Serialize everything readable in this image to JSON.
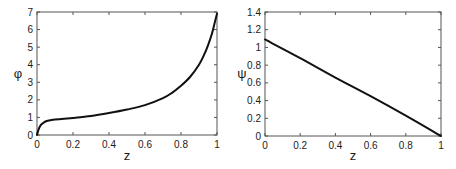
{
  "chart_data": [
    {
      "type": "line",
      "title": "",
      "xlabel": "z",
      "ylabel": "φ",
      "xlim": [
        0,
        1
      ],
      "ylim": [
        0,
        7
      ],
      "xticks": [
        0,
        0.2,
        0.4,
        0.6,
        0.8,
        1
      ],
      "xtick_labels": [
        "0",
        "0.2",
        "0.4",
        "0.6",
        "0.8",
        "1"
      ],
      "yticks": [
        0,
        1,
        2,
        3,
        4,
        5,
        6,
        7
      ],
      "ytick_labels": [
        "0",
        "1",
        "2",
        "3",
        "4",
        "5",
        "6",
        "7"
      ],
      "grid": false,
      "legend": null,
      "series": [
        {
          "name": "phi",
          "color": "#111111",
          "x": [
            0,
            0.01,
            0.02,
            0.03,
            0.05,
            0.08,
            0.1,
            0.15,
            0.2,
            0.3,
            0.4,
            0.5,
            0.6,
            0.7,
            0.75,
            0.8,
            0.85,
            0.9,
            0.93,
            0.95,
            0.97,
            0.99,
            1.0
          ],
          "y": [
            0,
            0.35,
            0.55,
            0.65,
            0.78,
            0.85,
            0.88,
            0.93,
            0.97,
            1.08,
            1.25,
            1.45,
            1.7,
            2.1,
            2.4,
            2.8,
            3.3,
            4.0,
            4.6,
            5.1,
            5.7,
            6.5,
            6.9
          ]
        }
      ]
    },
    {
      "type": "line",
      "title": "",
      "xlabel": "z",
      "ylabel": "ψ",
      "xlim": [
        0,
        1
      ],
      "ylim": [
        0,
        1.4
      ],
      "xticks": [
        0,
        0.2,
        0.4,
        0.6,
        0.8,
        1
      ],
      "xtick_labels": [
        "0",
        "0.2",
        "0.4",
        "0.6",
        "0.8",
        "1"
      ],
      "yticks": [
        0,
        0.2,
        0.4,
        0.6,
        0.8,
        1.0,
        1.2,
        1.4
      ],
      "ytick_labels": [
        "0",
        "0.2",
        "0.4",
        "0.6",
        "0.8",
        "1",
        "1.2",
        "1.4"
      ],
      "grid": false,
      "legend": null,
      "series": [
        {
          "name": "psi",
          "color": "#111111",
          "x": [
            0,
            0.2,
            0.4,
            0.6,
            0.8,
            1.0
          ],
          "y": [
            1.09,
            0.88,
            0.66,
            0.45,
            0.23,
            0.0
          ]
        }
      ]
    }
  ],
  "layout": {
    "panels": [
      {
        "frame": {
          "left": 37,
          "top": 12,
          "right": 217,
          "bottom": 135
        }
      },
      {
        "frame": {
          "left": 37,
          "top": 12,
          "right": 213,
          "bottom": 136
        }
      }
    ],
    "axis_color": "#555555",
    "line_width": 2
  }
}
